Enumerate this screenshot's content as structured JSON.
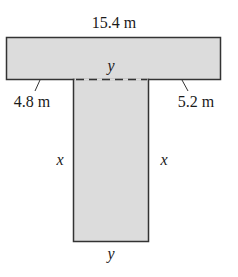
{
  "figure": {
    "shape": "T-shaped region",
    "fill_color": "#dcdcdc",
    "stroke_color": "#333333",
    "labels": {
      "top_width": "15.4 m",
      "left_overhang": "4.8 m",
      "right_overhang": "5.2 m",
      "dashed_join": "y",
      "stem_left_side": "x",
      "stem_right_side": "x",
      "stem_bottom": "y"
    }
  }
}
